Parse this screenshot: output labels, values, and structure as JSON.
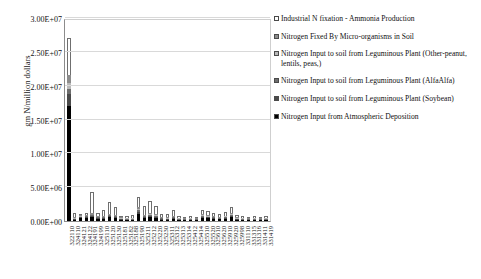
{
  "chart_data": {
    "type": "bar",
    "stacked": true,
    "title": "",
    "xlabel": "",
    "ylabel": "gm N/million dollars",
    "ylim": [
      0,
      30000000
    ],
    "ytick_labels": [
      "0.00E+00",
      "5.00E+06",
      "1.00E+07",
      "1.50E+07",
      "2.00E+07",
      "2.50E+07",
      "3.00E+07"
    ],
    "ytick_values": [
      0,
      5000000,
      10000000,
      15000000,
      20000000,
      25000000,
      30000000
    ],
    "grid": true,
    "legend_position": "right",
    "categories": [
      "322110",
      "324110",
      "324121",
      "324122",
      "324191",
      "324199",
      "325110",
      "325120",
      "325130",
      "325181",
      "325182",
      "325188",
      "325190",
      "325211",
      "325212",
      "325220",
      "325230",
      "325311",
      "325312",
      "325313",
      "325314",
      "325412",
      "325414",
      "325510",
      "325520",
      "325610",
      "325620",
      "325910",
      "325920",
      "325998",
      "331110",
      "331315",
      "331316",
      "331411",
      "331419"
    ],
    "series": [
      {
        "name": "Industrial N fixation - Ammonia Production",
        "color": "#ffffff",
        "values": [
          5400000,
          600000,
          220000,
          220000,
          3100000,
          420000,
          900000,
          1700000,
          1100000,
          260000,
          300000,
          340000,
          1450000,
          1250000,
          1850000,
          1250000,
          520000,
          560000,
          900000,
          200000,
          140000,
          200000,
          180000,
          600000,
          620000,
          520000,
          400000,
          480000,
          980000,
          340000,
          240000,
          160000,
          230000,
          120000,
          200000
        ]
      },
      {
        "name": "Nitrogen Fixed By Micro-organisms in Soil",
        "color": "#8c8c8c",
        "values": [
          1200000,
          60000,
          120000,
          160000,
          180000,
          120000,
          120000,
          170000,
          150000,
          60000,
          40000,
          40000,
          320000,
          140000,
          180000,
          160000,
          70000,
          60000,
          120000,
          40000,
          30000,
          40000,
          30000,
          150000,
          130000,
          100000,
          80000,
          120000,
          180000,
          60000,
          40000,
          30000,
          40000,
          20000,
          40000
        ]
      },
      {
        "name": "Nitrogen Input to soil from Leguminous Plant (Other-peanut, lentils, peas,)",
        "color": "#b9b9b9",
        "values": [
          900000,
          40000,
          70000,
          90000,
          110000,
          70000,
          80000,
          110000,
          90000,
          40000,
          30000,
          30000,
          200000,
          90000,
          110000,
          100000,
          50000,
          40000,
          80000,
          30000,
          20000,
          30000,
          20000,
          100000,
          90000,
          70000,
          50000,
          80000,
          120000,
          40000,
          30000,
          20000,
          30000,
          15000,
          30000
        ]
      },
      {
        "name": "Nitrogen Input to soil from Leguminous Plant (AlfaAlfa)",
        "color": "#6e6e6e",
        "values": [
          700000,
          30000,
          60000,
          70000,
          90000,
          60000,
          60000,
          90000,
          70000,
          30000,
          25000,
          25000,
          160000,
          70000,
          90000,
          80000,
          40000,
          30000,
          60000,
          25000,
          18000,
          25000,
          18000,
          80000,
          70000,
          55000,
          40000,
          60000,
          100000,
          35000,
          25000,
          18000,
          25000,
          12000,
          25000
        ]
      },
      {
        "name": "Nitrogen Input to soil from Leguminous Plant (Soybean)",
        "color": "#4a4a4a",
        "values": [
          1800000,
          70000,
          160000,
          200000,
          230000,
          150000,
          150000,
          220000,
          180000,
          70000,
          50000,
          50000,
          420000,
          180000,
          230000,
          200000,
          90000,
          80000,
          150000,
          50000,
          40000,
          50000,
          40000,
          190000,
          170000,
          130000,
          100000,
          150000,
          230000,
          80000,
          50000,
          40000,
          50000,
          25000,
          50000
        ]
      },
      {
        "name": "Nitrogen Input from Atmospheric Deposition",
        "color": "#000000",
        "values": [
          17000000,
          180000,
          380000,
          420000,
          520000,
          330000,
          340000,
          520000,
          430000,
          170000,
          120000,
          130000,
          980000,
          420000,
          540000,
          460000,
          210000,
          180000,
          340000,
          120000,
          90000,
          120000,
          90000,
          440000,
          400000,
          310000,
          240000,
          350000,
          540000,
          190000,
          120000,
          90000,
          120000,
          60000,
          120000
        ]
      }
    ]
  },
  "legend": {
    "items": [
      {
        "label": "Industrial N fixation - Ammonia Production",
        "swatch": "#ffffff"
      },
      {
        "label": "Nitrogen Fixed By Micro-organisms in Soil",
        "swatch": "#8c8c8c"
      },
      {
        "label": "Nitrogen Input to soil from Leguminous Plant (Other-peanut, lentils, peas,)",
        "swatch": "#b9b9b9"
      },
      {
        "label": "Nitrogen Input to soil from Leguminous Plant (AlfaAlfa)",
        "swatch": "#6e6e6e"
      },
      {
        "label": "Nitrogen Input to soil from Leguminous Plant (Soybean)",
        "swatch": "#4a4a4a"
      },
      {
        "label": "Nitrogen Input from Atmospheric Deposition",
        "swatch": "#000000"
      }
    ]
  }
}
